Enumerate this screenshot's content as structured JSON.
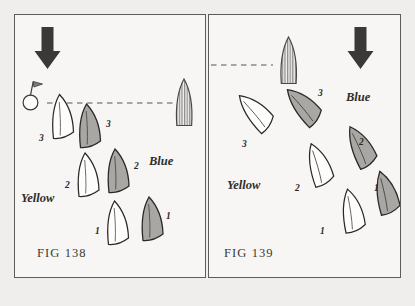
{
  "page": {
    "background_color": "#efeeec",
    "panel_background": "#f7f6f4",
    "border_color": "#5e5c59"
  },
  "colors": {
    "wind_arrow": "#3b3937",
    "blue_boat_fill": "#a9a7a4",
    "yellow_boat_fill": "#fdfdfc",
    "hull_outline": "#2b2927",
    "dashed_line": "#8d8b88",
    "committee_boat_stripe": "#8f8d8a",
    "text": "#2b2927"
  },
  "figures": [
    {
      "id": "fig-138",
      "caption": "FIG 138",
      "wind_arrow": {
        "name": "wind-direction-arrow",
        "direction": "down"
      },
      "start_line": {
        "name": "start-line",
        "style": "dashed",
        "orientation": "horizontal"
      },
      "mark_buoy": {
        "name": "mark-buoy",
        "has_flag": true
      },
      "committee_boat": {
        "name": "committee-boat",
        "fill": "striped",
        "heading": "up"
      },
      "team_labels": [
        {
          "name": "blue-team-label",
          "text": "Blue"
        },
        {
          "name": "yellow-team-label",
          "text": "Yellow"
        }
      ],
      "boats": [
        {
          "team": "Yellow",
          "position_number": "3"
        },
        {
          "team": "Blue",
          "position_number": "3"
        },
        {
          "team": "Yellow",
          "position_number": "2"
        },
        {
          "team": "Blue",
          "position_number": "2"
        },
        {
          "team": "Yellow",
          "position_number": "1"
        },
        {
          "team": "Blue",
          "position_number": "1"
        }
      ]
    },
    {
      "id": "fig-139",
      "caption": "FIG 139",
      "wind_arrow": {
        "name": "wind-direction-arrow",
        "direction": "down"
      },
      "start_line": {
        "name": "start-line",
        "style": "dashed",
        "orientation": "horizontal"
      },
      "mark_buoy": null,
      "committee_boat": {
        "name": "committee-boat",
        "fill": "striped",
        "heading": "up"
      },
      "team_labels": [
        {
          "name": "blue-team-label",
          "text": "Blue"
        },
        {
          "name": "yellow-team-label",
          "text": "Yellow"
        }
      ],
      "boats": [
        {
          "team": "Yellow",
          "position_number": "3"
        },
        {
          "team": "Blue",
          "position_number": "3"
        },
        {
          "team": "Yellow",
          "position_number": "2"
        },
        {
          "team": "Blue",
          "position_number": "2"
        },
        {
          "team": "Yellow",
          "position_number": "1"
        },
        {
          "team": "Blue",
          "position_number": "1"
        }
      ]
    }
  ]
}
